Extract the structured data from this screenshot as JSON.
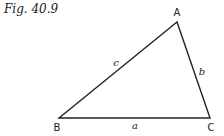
{
  "figure": {
    "caption": "Fig. 40.9"
  },
  "triangle": {
    "vertices": {
      "A": {
        "label": "A",
        "x": 177,
        "y": 22
      },
      "B": {
        "label": "B",
        "x": 59,
        "y": 118
      },
      "C": {
        "label": "C",
        "x": 210,
        "y": 118
      }
    },
    "sides": {
      "a": {
        "label": "a",
        "from": "B",
        "to": "C"
      },
      "b": {
        "label": "b",
        "from": "A",
        "to": "C"
      },
      "c": {
        "label": "c",
        "from": "A",
        "to": "B"
      }
    },
    "stroke_color": "#222222"
  }
}
